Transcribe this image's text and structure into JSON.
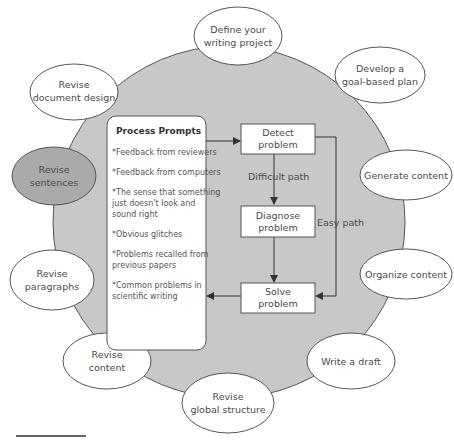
{
  "diagram": {
    "colors": {
      "circle_fill": "#c8c8c8",
      "stroke": "#555555",
      "ellipse_fill": "#ffffff",
      "highlight_fill": "#aaaaaa",
      "box_fill": "#ffffff",
      "arrow": "#333333"
    },
    "outer_steps": [
      {
        "id": "define",
        "line1": "Define your",
        "line2": "writing project"
      },
      {
        "id": "plan",
        "line1": "Develop a",
        "line2": "goal-based plan"
      },
      {
        "id": "generate",
        "line1": "Generate content",
        "line2": ""
      },
      {
        "id": "organize",
        "line1": "Organize content",
        "line2": ""
      },
      {
        "id": "draft",
        "line1": "Write a draft",
        "line2": ""
      },
      {
        "id": "global",
        "line1": "Revise",
        "line2": "global structure"
      },
      {
        "id": "content",
        "line1": "Revise",
        "line2": "content"
      },
      {
        "id": "paragraphs",
        "line1": "Revise",
        "line2": "paragraphs"
      },
      {
        "id": "sentences",
        "line1": "Revise",
        "line2": "sentences",
        "highlighted": true
      },
      {
        "id": "docdesign",
        "line1": "Revise",
        "line2": "document design"
      }
    ],
    "process_prompts": {
      "title": "Process Prompts",
      "items": [
        [
          "*Feedback from reviewers"
        ],
        [
          "*Feedback from computers"
        ],
        [
          "*The sense that something",
          "just doesn't look and",
          "sound right"
        ],
        [
          "*Obvious glitches"
        ],
        [
          "*Problems recalled from",
          "previous papers"
        ],
        [
          "*Common problems in",
          "scientific writing"
        ]
      ]
    },
    "flow_boxes": {
      "detect": {
        "line1": "Detect",
        "line2": "problem"
      },
      "diagnose": {
        "line1": "Diagnose",
        "line2": "problem"
      },
      "solve": {
        "line1": "Solve",
        "line2": "problem"
      }
    },
    "path_labels": {
      "difficult": "Difficult path",
      "easy": "Easy path"
    }
  }
}
